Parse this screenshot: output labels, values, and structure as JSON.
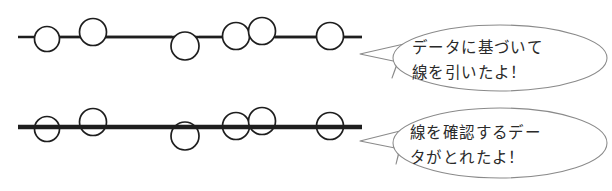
{
  "figure": {
    "background_color": "#ffffff",
    "ink_color": "#1e1e1e",
    "bubble_stroke_color": "#8a8a8a",
    "bubble_fill_color": "#ffffff",
    "text_color": "#2a2a2a"
  },
  "panels": [
    {
      "id": "top-panel",
      "name": "data-driven-line-panel",
      "line": {
        "label": "thin-trend-line",
        "thickness": 2.3,
        "x_start": 18,
        "x_end": 362,
        "y": 37
      },
      "points": [
        {
          "cx": 47,
          "cy": 39,
          "r": 12.5
        },
        {
          "cx": 93,
          "cy": 32,
          "r": 13.5
        },
        {
          "cx": 185,
          "cy": 46,
          "r": 14.0
        },
        {
          "cx": 236,
          "cy": 36,
          "r": 13.5
        },
        {
          "cx": 262,
          "cy": 31,
          "r": 13.5
        },
        {
          "cx": 330,
          "cy": 36,
          "r": 13.5
        }
      ],
      "bubble": {
        "name": "speech-bubble-top",
        "lines": [
          "データに基づいて",
          "線を引いたよ！"
        ],
        "cx": 500,
        "cy": 58,
        "rx": 107,
        "ry": 33,
        "tail_tip_x": 360,
        "tail_tip_y": 54
      }
    },
    {
      "id": "bottom-panel",
      "name": "line-confirming-data-panel",
      "line": {
        "label": "thick-trend-line",
        "thickness": 4.4,
        "x_start": 18,
        "x_end": 362,
        "y": 127
      },
      "points": [
        {
          "cx": 47,
          "cy": 129,
          "r": 12.5
        },
        {
          "cx": 93,
          "cy": 122,
          "r": 13.5
        },
        {
          "cx": 185,
          "cy": 136,
          "r": 14.0
        },
        {
          "cx": 236,
          "cy": 126,
          "r": 13.5
        },
        {
          "cx": 262,
          "cy": 121,
          "r": 13.5
        },
        {
          "cx": 330,
          "cy": 126,
          "r": 13.5
        }
      ],
      "bubble": {
        "name": "speech-bubble-bottom",
        "lines": [
          "線を確認するデー",
          "タがとれたよ！"
        ],
        "cx": 500,
        "cy": 143,
        "rx": 107,
        "ry": 35,
        "tail_tip_x": 360,
        "tail_tip_y": 140
      }
    }
  ],
  "text": {
    "top_line_1": "データに基づいて",
    "top_line_2": "線を引いたよ！",
    "bottom_line_1": "線を確認するデー",
    "bottom_line_2": "タがとれたよ！"
  }
}
